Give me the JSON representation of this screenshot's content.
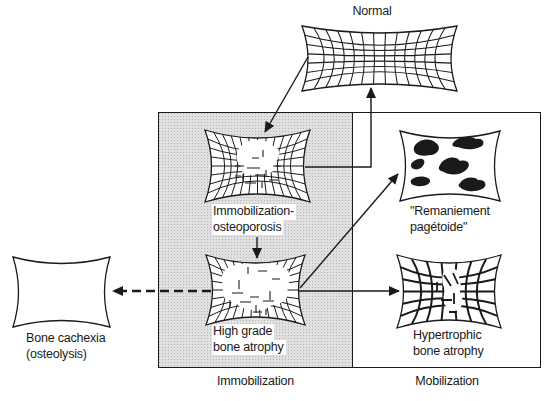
{
  "diagram": {
    "nodes": {
      "normal": {
        "label": "Normal"
      },
      "immobilization_osteoporosis": {
        "line1": "Immobilization-",
        "line2": "osteoporosis"
      },
      "remaniement_pagetoide": {
        "line1": "\"Remaniement",
        "line2": "pagétoide\""
      },
      "high_grade_bone_atrophy": {
        "line1": "High grade",
        "line2": "bone atrophy"
      },
      "hypertrophic_bone_atrophy": {
        "line1": "Hypertrophic",
        "line2": "bone atrophy"
      },
      "bone_cachexia": {
        "line1": "Bone cachexia",
        "line2": "(osteolysis)"
      }
    },
    "zones": {
      "left_label": "Immobilization",
      "right_label": "Mobilization"
    },
    "colors": {
      "ink": "#1a1a1a",
      "zone_shade": "#e0e0e0",
      "shade_dot": "#b5b5b5",
      "white": "#ffffff"
    }
  }
}
